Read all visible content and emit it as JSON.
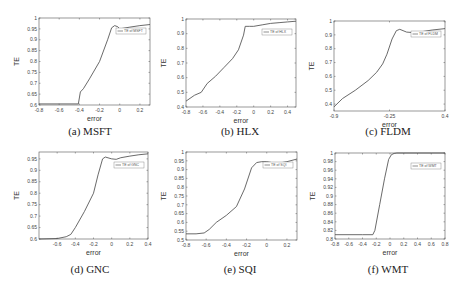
{
  "figure": {
    "colors": {
      "line": "#444444",
      "axis": "#555555",
      "grid_tick": "#999999",
      "background": "#ffffff"
    }
  },
  "chart_data": [
    {
      "type": "line",
      "id": "a",
      "caption": "(a) MSFT",
      "title": "",
      "xlabel": "error",
      "ylabel": "TE",
      "xlim": [
        -0.8,
        0.3
      ],
      "ylim": [
        0.6,
        1.0
      ],
      "xticks": [
        "-0.8",
        "-0.6",
        "-0.4",
        "-0.2",
        "0",
        "0.2"
      ],
      "xtick_values": [
        -0.8,
        -0.6,
        -0.4,
        -0.2,
        0,
        0.2
      ],
      "yticks": [
        "0.6",
        "0.65",
        "0.7",
        "0.75",
        "0.8",
        "0.85",
        "0.9",
        "0.95",
        "1"
      ],
      "ytick_values": [
        0.6,
        0.65,
        0.7,
        0.75,
        0.8,
        0.85,
        0.9,
        0.95,
        1.0
      ],
      "legend": "TE of MSFT",
      "legend_position": "upper right",
      "grid": false,
      "series": [
        {
          "name": "TE of MSFT",
          "x": [
            -0.8,
            -0.6,
            -0.41,
            -0.39,
            -0.36,
            -0.3,
            -0.2,
            -0.12,
            -0.08,
            -0.05,
            -0.02,
            0.0,
            0.1,
            0.2,
            0.3
          ],
          "y": [
            0.605,
            0.605,
            0.605,
            0.66,
            0.675,
            0.72,
            0.8,
            0.9,
            0.955,
            0.965,
            0.96,
            0.95,
            0.958,
            0.965,
            0.97
          ]
        }
      ]
    },
    {
      "type": "line",
      "id": "b",
      "caption": "(b) HLX",
      "title": "",
      "xlabel": "error",
      "ylabel": "TE",
      "xlim": [
        -0.8,
        0.5
      ],
      "ylim": [
        0.4,
        1.0
      ],
      "xticks": [
        "-0.8",
        "-0.6",
        "-0.4",
        "-0.2",
        "0",
        "0.2",
        "0.4"
      ],
      "xtick_values": [
        -0.8,
        -0.6,
        -0.4,
        -0.2,
        0,
        0.2,
        0.4
      ],
      "yticks": [
        "0.4",
        "0.5",
        "0.6",
        "0.7",
        "0.8",
        "0.9",
        "1"
      ],
      "ytick_values": [
        0.4,
        0.5,
        0.6,
        0.7,
        0.8,
        0.9,
        1.0
      ],
      "legend": "TE of HLX",
      "legend_position": "upper right",
      "grid": false,
      "series": [
        {
          "name": "TE of HLX",
          "x": [
            -0.8,
            -0.7,
            -0.62,
            -0.55,
            -0.45,
            -0.35,
            -0.25,
            -0.18,
            -0.12,
            -0.1,
            -0.05,
            0.0,
            0.1,
            0.2,
            0.3,
            0.4,
            0.5
          ],
          "y": [
            0.44,
            0.48,
            0.5,
            0.56,
            0.61,
            0.67,
            0.73,
            0.79,
            0.89,
            0.95,
            0.95,
            0.95,
            0.96,
            0.97,
            0.975,
            0.98,
            0.985
          ]
        }
      ]
    },
    {
      "type": "line",
      "id": "c",
      "caption": "(c) FLDM",
      "title": "",
      "xlabel": "error",
      "ylabel": "TE",
      "xlim": [
        -0.9,
        0.4
      ],
      "ylim": [
        0.35,
        1.0
      ],
      "xticks": [
        "-0.9",
        "-0.25",
        "0.4"
      ],
      "xtick_values": [
        -0.9,
        -0.25,
        0.4
      ],
      "yticks": [
        "0.4",
        "0.5",
        "0.6",
        "0.7",
        "0.8",
        "0.9",
        "1"
      ],
      "ytick_values": [
        0.4,
        0.5,
        0.6,
        0.7,
        0.8,
        0.9,
        1.0
      ],
      "legend": "TE of FLDM",
      "legend_position": "upper right",
      "grid": false,
      "series": [
        {
          "name": "TE of FLDM",
          "x": [
            -0.9,
            -0.8,
            -0.65,
            -0.5,
            -0.4,
            -0.33,
            -0.28,
            -0.22,
            -0.17,
            -0.13,
            -0.05,
            0.05,
            0.15,
            0.25,
            0.4
          ],
          "y": [
            0.38,
            0.44,
            0.5,
            0.57,
            0.63,
            0.69,
            0.76,
            0.87,
            0.93,
            0.94,
            0.92,
            0.915,
            0.925,
            0.935,
            0.945
          ]
        }
      ]
    },
    {
      "type": "line",
      "id": "d",
      "caption": "(d) GNC",
      "title": "",
      "xlabel": "error",
      "ylabel": "TE",
      "xlim": [
        -0.8,
        0.4
      ],
      "ylim": [
        0.6,
        0.98
      ],
      "xticks": [
        "-0.6",
        "-0.4",
        "-0.2",
        "0",
        "0.2",
        "0.4"
      ],
      "xtick_values": [
        -0.6,
        -0.4,
        -0.2,
        0,
        0.2,
        0.4
      ],
      "yticks": [
        "0.6",
        "0.65",
        "0.7",
        "0.75",
        "0.8",
        "0.85",
        "0.9",
        "0.95"
      ],
      "ytick_values": [
        0.6,
        0.65,
        0.7,
        0.75,
        0.8,
        0.85,
        0.9,
        0.95
      ],
      "legend": "TE of GNC",
      "legend_position": "upper right",
      "grid": false,
      "series": [
        {
          "name": "TE of GNC",
          "x": [
            -0.8,
            -0.6,
            -0.5,
            -0.45,
            -0.4,
            -0.3,
            -0.2,
            -0.15,
            -0.1,
            -0.07,
            0.0,
            0.05,
            0.1,
            0.2,
            0.3,
            0.4
          ],
          "y": [
            0.6,
            0.602,
            0.61,
            0.62,
            0.65,
            0.72,
            0.8,
            0.88,
            0.95,
            0.958,
            0.95,
            0.948,
            0.955,
            0.962,
            0.968,
            0.972
          ]
        }
      ]
    },
    {
      "type": "line",
      "id": "e",
      "caption": "(e) SQI",
      "title": "",
      "xlabel": "error",
      "ylabel": "TE",
      "xlim": [
        -0.8,
        0.3
      ],
      "ylim": [
        0.5,
        1.0
      ],
      "xticks": [
        "-0.8",
        "-0.6",
        "-0.4",
        "-0.2",
        "0",
        "0.2"
      ],
      "xtick_values": [
        -0.8,
        -0.6,
        -0.4,
        -0.2,
        0,
        0.2
      ],
      "yticks": [
        "0.5",
        "0.55",
        "0.6",
        "0.65",
        "0.7",
        "0.75",
        "0.8",
        "0.85",
        "0.9",
        "0.95",
        "1"
      ],
      "ytick_values": [
        0.5,
        0.55,
        0.6,
        0.65,
        0.7,
        0.75,
        0.8,
        0.85,
        0.9,
        0.95,
        1.0
      ],
      "legend": "TE of SQI",
      "legend_position": "upper right",
      "grid": false,
      "series": [
        {
          "name": "TE of SQI",
          "x": [
            -0.8,
            -0.7,
            -0.62,
            -0.57,
            -0.5,
            -0.4,
            -0.3,
            -0.22,
            -0.15,
            -0.1,
            -0.05,
            0.0,
            0.05,
            0.1,
            0.2,
            0.3
          ],
          "y": [
            0.535,
            0.535,
            0.54,
            0.56,
            0.6,
            0.64,
            0.69,
            0.79,
            0.91,
            0.94,
            0.945,
            0.945,
            0.94,
            0.935,
            0.945,
            0.96
          ]
        }
      ]
    },
    {
      "type": "line",
      "id": "f",
      "caption": "(f) WMT",
      "title": "",
      "xlabel": "error",
      "ylabel": "TE",
      "xlim": [
        -0.8,
        0.8
      ],
      "ylim": [
        0.8,
        1.0
      ],
      "xticks": [
        "-0.8",
        "-0.6",
        "-0.4",
        "-0.2",
        "0",
        "0.2",
        "0.4",
        "0.6",
        "0.8"
      ],
      "xtick_values": [
        -0.8,
        -0.6,
        -0.4,
        -0.2,
        0,
        0.2,
        0.4,
        0.6,
        0.8
      ],
      "yticks": [
        "0.8",
        "0.82",
        "0.84",
        "0.86",
        "0.88",
        "0.9",
        "0.92",
        "0.94",
        "0.96",
        "0.98",
        "1"
      ],
      "ytick_values": [
        0.8,
        0.82,
        0.84,
        0.86,
        0.88,
        0.9,
        0.92,
        0.94,
        0.96,
        0.98,
        1.0
      ],
      "legend": "TE of WMT",
      "legend_position": "upper right",
      "grid": false,
      "series": [
        {
          "name": "TE of WMT",
          "x": [
            -0.8,
            -0.4,
            -0.25,
            -0.22,
            -0.15,
            -0.08,
            -0.02,
            0.02,
            0.06,
            0.1,
            0.2,
            0.4,
            0.6,
            0.8
          ],
          "y": [
            0.81,
            0.81,
            0.81,
            0.82,
            0.88,
            0.94,
            0.985,
            0.996,
            0.999,
            1.0,
            1.0,
            1.0,
            1.0,
            1.0
          ]
        }
      ]
    }
  ]
}
